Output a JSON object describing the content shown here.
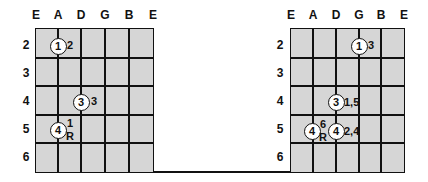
{
  "diagrams": [
    {
      "id": "left",
      "strings": [
        "E",
        "A",
        "D",
        "G",
        "B",
        "E"
      ],
      "frets": [
        "2",
        "3",
        "4",
        "5",
        "6"
      ],
      "markers": [
        {
          "finger": "1",
          "string": "A",
          "fret": "2",
          "label": "2"
        },
        {
          "finger": "3",
          "string": "D",
          "fret": "4",
          "label": "3"
        },
        {
          "finger": "4",
          "string": "A",
          "fret": "5",
          "label_top": "1",
          "label_bottom": "R"
        }
      ]
    },
    {
      "id": "right",
      "strings": [
        "E",
        "A",
        "D",
        "G",
        "B",
        "E"
      ],
      "frets": [
        "2",
        "3",
        "4",
        "5",
        "6"
      ],
      "markers": [
        {
          "finger": "1",
          "string": "G",
          "fret": "2",
          "label": "3"
        },
        {
          "finger": "3",
          "string": "D",
          "fret": "4",
          "label": "1,5"
        },
        {
          "finger": "4",
          "string": "A",
          "fret": "5",
          "label_top": "6",
          "label_bottom": "R"
        },
        {
          "finger": "4",
          "string": "D",
          "fret": "5",
          "label": "2,4"
        }
      ]
    }
  ],
  "colors": {
    "grid_fill": "#d6d6d6",
    "line": "#111111",
    "marker_fill": "#ffffff"
  }
}
